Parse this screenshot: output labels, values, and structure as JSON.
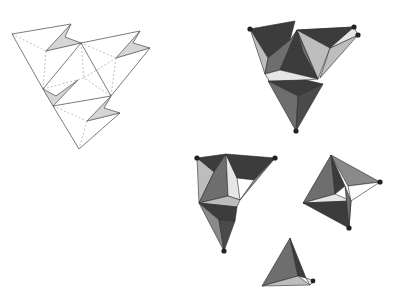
{
  "figure": {
    "colors": {
      "background": "#ffffff",
      "net_edge": "#5a5a5a",
      "fold_line": "#b0b0b0",
      "flap_fill": "#d6d6d6",
      "face_dark": "#3c3c3c",
      "face_mid": "#6e6e6e",
      "face_light": "#bdbdbd",
      "face_white": "#e6e6e6",
      "vertex_dot": "#222222"
    },
    "panels": [
      {
        "id": "flat-net",
        "label": "",
        "position": "top-left"
      },
      {
        "id": "folded-assembly",
        "label": "",
        "position": "top-right"
      },
      {
        "id": "partial-fold-a",
        "label": "",
        "position": "middle-left"
      },
      {
        "id": "partial-fold-b",
        "label": "",
        "position": "middle-right"
      },
      {
        "id": "single-tetrahedron",
        "label": "",
        "position": "bottom"
      }
    ]
  }
}
